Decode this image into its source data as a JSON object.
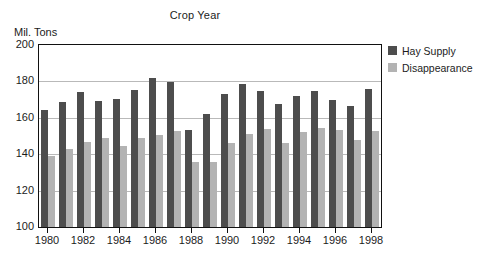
{
  "chart_data": {
    "type": "bar",
    "title": "Crop Year",
    "xlabel": "",
    "ylabel": "Mil. Tons",
    "ylim": [
      100,
      200
    ],
    "yticks": [
      100,
      120,
      140,
      160,
      180,
      200
    ],
    "grid": true,
    "legend_position": "right",
    "categories": [
      "1980",
      "1981",
      "1982",
      "1983",
      "1984",
      "1985",
      "1986",
      "1987",
      "1988",
      "1989",
      "1990",
      "1991",
      "1992",
      "1993",
      "1994",
      "1995",
      "1996",
      "1997",
      "1998"
    ],
    "xtick_labels": [
      "1980",
      "1982",
      "1984",
      "1986",
      "1988",
      "1990",
      "1992",
      "1994",
      "1996",
      "1998"
    ],
    "series": [
      {
        "name": "Hay Supply",
        "color": "#4d4d4d",
        "values": [
          164.5,
          168.5,
          174.0,
          169.0,
          170.5,
          175.5,
          182.0,
          179.5,
          153.5,
          162.0,
          173.0,
          178.5,
          174.5,
          167.5,
          172.0,
          174.5,
          170.0,
          166.5,
          176.0
        ]
      },
      {
        "name": "Disappearance",
        "color": "#b3b3b3",
        "values": [
          139.0,
          143.0,
          146.5,
          149.0,
          144.5,
          149.0,
          150.5,
          153.0,
          135.5,
          135.5,
          146.0,
          151.0,
          154.0,
          146.0,
          152.0,
          154.5,
          153.5,
          148.0,
          152.5
        ]
      }
    ]
  },
  "legend": {
    "items": [
      {
        "label": "Hay Supply",
        "color": "#4d4d4d"
      },
      {
        "label": "Disappearance",
        "color": "#b3b3b3"
      }
    ]
  }
}
